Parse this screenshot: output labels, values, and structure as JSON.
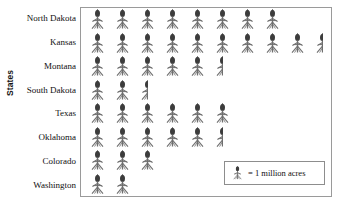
{
  "chart_data": {
    "type": "bar",
    "subtype": "pictograph",
    "title": "",
    "xlabel": "",
    "ylabel": "States",
    "categories": [
      "North Dakota",
      "Kansas",
      "Montana",
      "South Dakota",
      "Texas",
      "Oklahoma",
      "Colorado",
      "Washington"
    ],
    "values": [
      8,
      9.5,
      5.5,
      2.5,
      6,
      5.5,
      3,
      2
    ],
    "unit": "million acres",
    "icon_unit_value": 1,
    "icon_counts": [
      {
        "category": "North Dakota",
        "full": 8,
        "half": 0,
        "value": 8
      },
      {
        "category": "Kansas",
        "full": 9,
        "half": 1,
        "value": 9.5
      },
      {
        "category": "Montana",
        "full": 5,
        "half": 1,
        "value": 5.5
      },
      {
        "category": "South Dakota",
        "full": 2,
        "half": 1,
        "value": 2.5
      },
      {
        "category": "Texas",
        "full": 6,
        "half": 0,
        "value": 6
      },
      {
        "category": "Oklahoma",
        "full": 5,
        "half": 1,
        "value": 5.5
      },
      {
        "category": "Colorado",
        "full": 3,
        "half": 0,
        "value": 3
      },
      {
        "category": "Washington",
        "full": 2,
        "half": 0,
        "value": 2
      }
    ],
    "grid": false,
    "legend_position": "inside-bottom-right"
  },
  "axis": {
    "y_title": "States"
  },
  "legend": {
    "icon_name": "wheat-stalk-icon",
    "text": "= 1 million acres"
  },
  "colors": {
    "icon": "#6f6f6f",
    "icon_head": "#3d3d3d",
    "frame": "#9a9a9a",
    "legend_border": "#8d8d8d",
    "text": "#101010"
  }
}
